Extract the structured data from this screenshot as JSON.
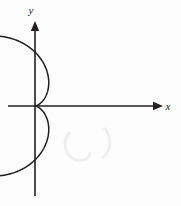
{
  "figure": {
    "background_color": "#fdfdfd",
    "ink_color": "#231f20",
    "axes": {
      "x_label": "x",
      "y_label": "y",
      "origin": {
        "x": 35,
        "y": 106
      },
      "x_axis": {
        "start_x": 8,
        "end_x": 163,
        "y": 106,
        "arrow": "right"
      },
      "y_axis": {
        "x": 35,
        "start_y": 196,
        "end_y": 21,
        "arrow": "up"
      }
    },
    "labels": {
      "x": {
        "text": "x",
        "x": 168,
        "y": 110
      },
      "y": {
        "text": "y",
        "x": 31,
        "y": 14
      }
    }
  },
  "chart_data": {
    "type": "line",
    "xlabel": "x",
    "ylabel": "y",
    "grid": false,
    "legend": null,
    "curve": {
      "name": "cardioid",
      "polar_equation": "r = a(1 - cos(theta))",
      "cusp_point": {
        "x": 0,
        "y": 0
      },
      "symmetry": "x-axis",
      "opens": "right",
      "pixel_extents": {
        "left_x": 20,
        "right_x": 145,
        "top_y": 36,
        "bottom_y": 176
      },
      "data_extents": {
        "x_min": -0.1388,
        "x_max": 2.0,
        "y_min": -1.299,
        "y_max": 1.299
      },
      "scale": {
        "a": 1.0,
        "pixels_per_unit_x": 55,
        "pixels_per_unit_y": 53.9
      },
      "points_polar": [
        {
          "theta_deg": 0,
          "r": 0.0
        },
        {
          "theta_deg": 15,
          "r": 0.0341
        },
        {
          "theta_deg": 30,
          "r": 0.134
        },
        {
          "theta_deg": 45,
          "r": 0.2929
        },
        {
          "theta_deg": 60,
          "r": 0.5
        },
        {
          "theta_deg": 75,
          "r": 0.7412
        },
        {
          "theta_deg": 90,
          "r": 1.0
        },
        {
          "theta_deg": 105,
          "r": 1.2588
        },
        {
          "theta_deg": 120,
          "r": 1.5
        },
        {
          "theta_deg": 135,
          "r": 1.7071
        },
        {
          "theta_deg": 150,
          "r": 1.866
        },
        {
          "theta_deg": 165,
          "r": 1.9659
        },
        {
          "theta_deg": 180,
          "r": 2.0
        },
        {
          "theta_deg": 195,
          "r": 1.9659
        },
        {
          "theta_deg": 210,
          "r": 1.866
        },
        {
          "theta_deg": 225,
          "r": 1.7071
        },
        {
          "theta_deg": 240,
          "r": 1.5
        },
        {
          "theta_deg": 255,
          "r": 1.2588
        },
        {
          "theta_deg": 270,
          "r": 1.0
        },
        {
          "theta_deg": 285,
          "r": 0.7412
        },
        {
          "theta_deg": 300,
          "r": 0.5
        },
        {
          "theta_deg": 315,
          "r": 0.2929
        },
        {
          "theta_deg": 330,
          "r": 0.134
        },
        {
          "theta_deg": 345,
          "r": 0.0341
        },
        {
          "theta_deg": 360,
          "r": 0.0
        }
      ]
    }
  }
}
